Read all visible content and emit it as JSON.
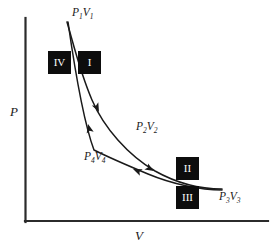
{
  "figure": {
    "type": "pv-diagram",
    "title": "",
    "axes": {
      "y_label": "P",
      "x_label": "V",
      "origin_px": [
        25,
        222
      ],
      "y_axis_top_px": [
        25,
        18
      ],
      "x_axis_right_px": [
        268,
        222
      ]
    },
    "state_labels": [
      {
        "id": "state-1",
        "text": "P1V1",
        "p": "P",
        "p_sub": "1",
        "v": "V",
        "v_sub": "1",
        "x": 72,
        "y": 8
      },
      {
        "id": "state-2",
        "text": "P2V2",
        "p": "P",
        "p_sub": "2",
        "v": "V",
        "v_sub": "2",
        "x": 136,
        "y": 122
      },
      {
        "id": "state-3",
        "text": "P3V3",
        "p": "P",
        "p_sub": "3",
        "v": "V",
        "v_sub": "3",
        "x": 219,
        "y": 192
      },
      {
        "id": "state-4",
        "text": "P4V4",
        "p": "P",
        "p_sub": "4",
        "v": "V",
        "v_sub": "4",
        "x": 84,
        "y": 152
      }
    ],
    "process_boxes": [
      {
        "id": "process-iv",
        "label": "IV",
        "x": 48,
        "y": 51
      },
      {
        "id": "process-i",
        "label": "I",
        "x": 78,
        "y": 51
      },
      {
        "id": "process-ii",
        "label": "II",
        "x": 176,
        "y": 157
      },
      {
        "id": "process-iii",
        "label": "III",
        "x": 176,
        "y": 186
      }
    ],
    "curves": {
      "upper": {
        "name": "expansion-curve",
        "direction": "forward",
        "path": "M 67,22 C 74,46 80,72 92,100 C 104,128 128,155 155,171 C 180,185 205,189 222,189"
      },
      "lower": {
        "name": "compression-curve",
        "direction": "reverse",
        "path": "M 222,190 C 200,190 172,184 148,174 C 124,164 106,156 94,150 C 88,134 80,106 68,22"
      }
    },
    "arrows": [
      {
        "name": "arrow-expansion-upper",
        "x": 99,
        "y": 112,
        "angle": 62
      },
      {
        "name": "arrow-expansion-lower",
        "x": 152,
        "y": 170,
        "angle": 32
      },
      {
        "name": "arrow-compression-lower",
        "x": 139,
        "y": 172,
        "angle": 205
      },
      {
        "name": "arrow-compression-upper",
        "x": 89,
        "y": 128,
        "angle": 256
      }
    ],
    "colors": {
      "ink": "#1a1a1a",
      "axis": "#2b2b2b",
      "box_fill": "#0d0d0d",
      "box_text": "#ffffff",
      "background": "#ffffff"
    }
  }
}
